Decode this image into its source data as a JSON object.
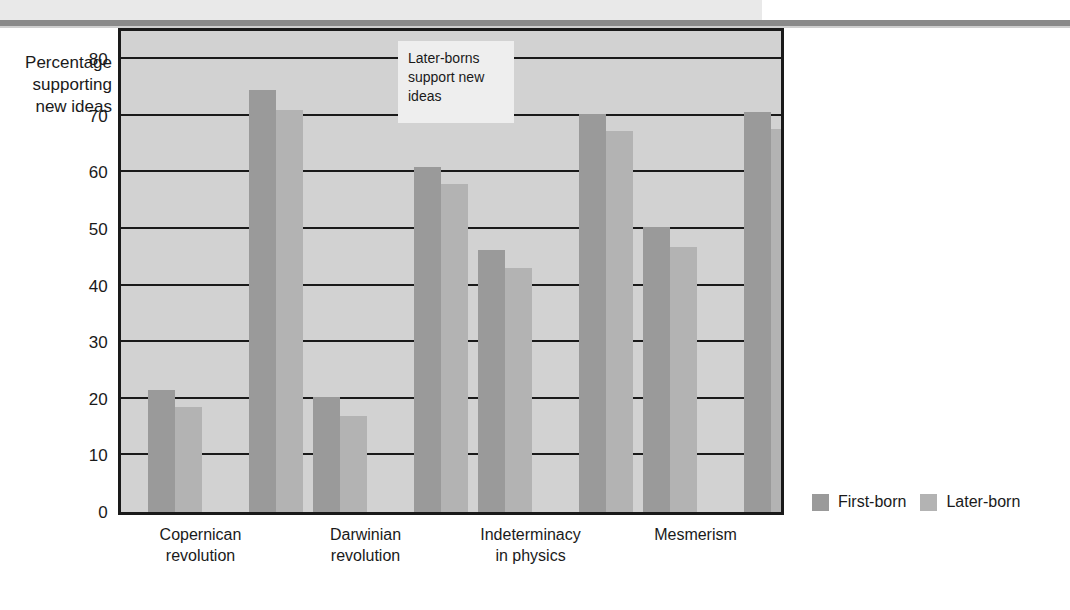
{
  "chart_data": {
    "type": "bar",
    "title": "",
    "xlabel": "",
    "ylabel": "Percentage supporting new ideas",
    "ylim": [
      0,
      85
    ],
    "yticks": [
      0,
      10,
      20,
      30,
      40,
      50,
      60,
      70,
      80
    ],
    "grid": true,
    "legend_position": "bottom-right",
    "categories": [
      "Copernican\nrevolution",
      "Darwinian\nrevolution",
      "Indeterminacy\nin physics",
      "Mesmerism"
    ],
    "group_labels": [
      "Low-status group",
      "High-status group"
    ],
    "series": [
      {
        "name": "First-born",
        "color": "#9a9a9a",
        "values_pair_a": [
          21.5,
          20.3,
          46.3,
          50.4
        ],
        "values_pair_b": [
          74.5,
          61.0,
          70.4,
          70.7
        ]
      },
      {
        "name": "Later-born",
        "color": "#b3b3b3",
        "values_pair_a": [
          18.5,
          17.0,
          43.2,
          46.8
        ],
        "values_pair_b": [
          71.0,
          58.0,
          67.4,
          67.6
        ]
      }
    ],
    "annotations": [
      {
        "text": "Later-borns support new ideas"
      }
    ]
  },
  "y_axis": {
    "title_lines": [
      "Percentage",
      "supporting",
      "new ideas"
    ],
    "ticks": [
      "80",
      "70",
      "60",
      "50",
      "40",
      "30",
      "20",
      "10",
      "0"
    ]
  },
  "x_axis": {
    "labels": [
      "Copernican\nrevolution",
      "Darwinian\nrevolution",
      "Indeterminacy\nin physics",
      "Mesmerism"
    ]
  },
  "annotation": {
    "text": "Later-borns support new ideas"
  },
  "legend": {
    "items": [
      {
        "label": "First-born",
        "color": "#9a9a9a"
      },
      {
        "label": "Later-born",
        "color": "#b3b3b3"
      }
    ]
  },
  "colors": {
    "plot_background": "#d2d2d2",
    "axis": "#1a1a1a",
    "first_born": "#9a9a9a",
    "later_born": "#b3b3b3",
    "top_band": "#e9e9e9",
    "top_rule": "#8a8a8a"
  }
}
